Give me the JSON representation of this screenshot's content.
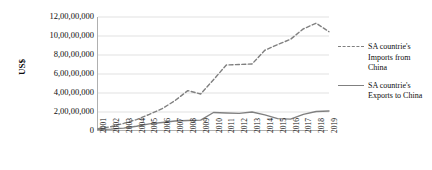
{
  "chart_data": {
    "type": "line",
    "title": "",
    "xlabel": "",
    "ylabel": "US$",
    "ylim": [
      0,
      120000000
    ],
    "ytick_labels": [
      "12,00,00,000",
      "10,00,00,000",
      "8,00,00,000",
      "6,00,00,000",
      "4,00,00,000",
      "2,00,00,000",
      "0"
    ],
    "ytick_values": [
      120000000,
      100000000,
      80000000,
      60000000,
      40000000,
      20000000,
      0
    ],
    "grid": true,
    "legend_position": "right",
    "categories": [
      "2001",
      "2002",
      "2003",
      "2004",
      "2005",
      "2006",
      "2007",
      "2008",
      "2009",
      "2010",
      "2011",
      "2012",
      "2013",
      "2014",
      "2015",
      "2016",
      "2017",
      "2018",
      "2019"
    ],
    "series": [
      {
        "name": "SA countrie's Imports from China",
        "style": "dashed",
        "color": "#808080",
        "values": [
          2500000,
          4500000,
          8000000,
          12000000,
          17500000,
          23500000,
          32000000,
          42500000,
          39000000,
          54000000,
          69500000,
          70000000,
          70500000,
          85000000,
          91000000,
          96500000,
          107500000,
          113500000,
          104500000
        ]
      },
      {
        "name": "SA countrie's Exports to China",
        "style": "solid",
        "color": "#808080",
        "values": [
          1500000,
          2000000,
          3000000,
          5000000,
          7500000,
          9000000,
          10500000,
          11000000,
          11500000,
          19500000,
          19000000,
          18500000,
          20000000,
          17000000,
          13000000,
          12500000,
          17500000,
          20500000,
          21000000
        ]
      }
    ]
  },
  "legend": {
    "entries": [
      {
        "label": "SA countrie's Imports from China",
        "marker": "dashed-line-marker"
      },
      {
        "label": "SA countrie's Exports to China",
        "marker": "solid-line-marker"
      }
    ]
  }
}
